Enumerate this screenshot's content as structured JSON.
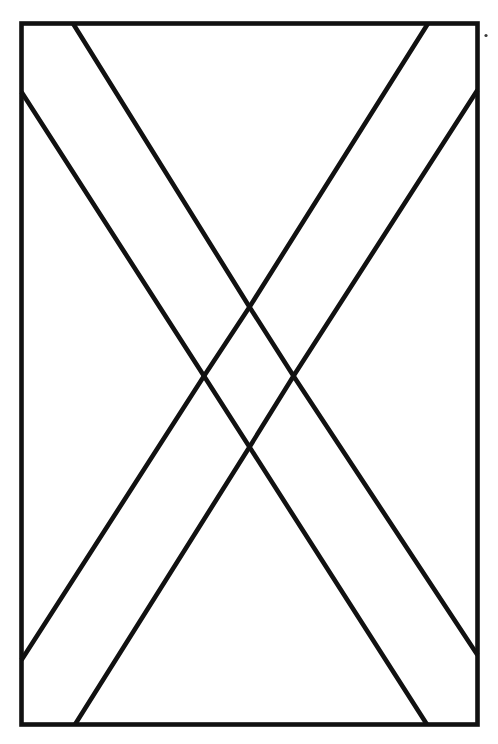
{
  "document": {
    "type": "line-drawing",
    "subject": "flag-with-saltire-cross",
    "title": "Saltire flag outline drawing",
    "description": "Black outline line drawing of a rectangular flag containing a diagonal cross (saltire) formed by two crossing bands, drawn as outlines on a white field.",
    "canvas": {
      "width": 498,
      "height": 744,
      "background_color": "#ffffff"
    },
    "stroke": {
      "color": "#111111",
      "width": 4.6,
      "linejoin": "miter",
      "linecap": "butt"
    },
    "text_content": [],
    "labels": [],
    "annotations": []
  },
  "geometry": {
    "border_rect": {
      "name": "flag-outline",
      "left": 21.5,
      "top": 23.5,
      "right": 477.5,
      "bottom": 724.5
    },
    "saltire": {
      "name": "diagonal-cross-bands",
      "center_diamond": {
        "top": [
          249.5,
          307.0
        ],
        "left": [
          204.0,
          376.0
        ],
        "right": [
          293.5,
          376.0
        ],
        "bottom": [
          249.5,
          447.0
        ]
      },
      "edge_anchors": {
        "top_border_left_x": 73.0,
        "top_border_right_x": 428.0,
        "bottom_border_left_x": 75.0,
        "bottom_border_right_x": 427.0,
        "left_border_upper_y": 92.0,
        "left_border_lower_y": 660.0,
        "right_border_upper_y": 90.0,
        "right_border_lower_y": 655.0
      },
      "bands": [
        {
          "name": "band-top-left-to-center",
          "points": "73,23.5 249.5,307 204,376 21.5,92"
        },
        {
          "name": "band-top-right-to-center",
          "points": "428,23.5 249.5,307 293.5,376 477.5,90"
        },
        {
          "name": "band-bottom-left-to-center",
          "points": "75,724.5 249.5,447 204,376 21.5,660"
        },
        {
          "name": "band-bottom-right-to-center",
          "points": "427,724.5 249.5,447 293.5,376 477.5,655"
        }
      ]
    },
    "ink_speck": {
      "name": "ink-speck-artifact",
      "cx": 486.0,
      "cy": 35.5,
      "r": 1.6,
      "color": "#3a3a3a"
    }
  }
}
